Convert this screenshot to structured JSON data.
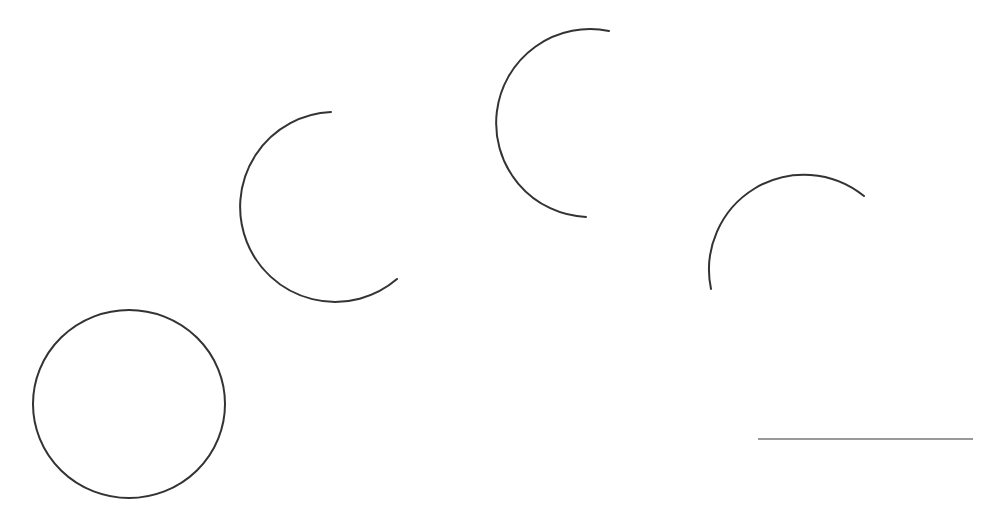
{
  "diagram": {
    "background": "#ffffff",
    "stroke_color": "#333333",
    "line_color": "#777777",
    "shapes": [
      {
        "id": "full-circle",
        "type": "circle",
        "cx": 129,
        "cy": 404,
        "rx": 96,
        "ry": 94
      },
      {
        "id": "arc-2",
        "type": "arc",
        "d": "M 331 112 A 95 95 0 1 0 397 279"
      },
      {
        "id": "arc-3",
        "type": "arc",
        "d": "M 609 31 A 94 94 0 1 0 586 217"
      },
      {
        "id": "arc-4",
        "type": "arc",
        "d": "M 711 289 A 95 95 0 0 1 864 196"
      }
    ],
    "line": {
      "x1": 758,
      "y1": 439,
      "x2": 973,
      "y2": 439
    }
  }
}
